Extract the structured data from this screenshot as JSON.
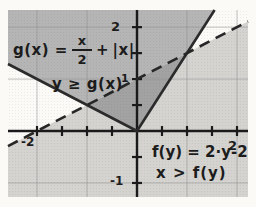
{
  "figure": {
    "bg": "#fbfaf7",
    "plot": {
      "left": 8,
      "top": 10,
      "right": 248,
      "bottom": 197
    },
    "grid_color": "#8f8f8f",
    "axis_color": "#1a1a1a"
  },
  "chart_data": {
    "type": "line",
    "title": "",
    "xlabel": "",
    "ylabel": "",
    "xlim": [
      -2.58,
      2.22
    ],
    "ylim": [
      -1.27,
      2.33
    ],
    "grid": true,
    "x_gridlines": [
      -2,
      -1,
      1,
      2
    ],
    "y_gridlines": [
      -1,
      1,
      2
    ],
    "x_ticks": [
      -2,
      -1.5,
      -1,
      -0.5,
      0.5,
      1,
      1.5,
      2
    ],
    "y_ticks": [
      -1,
      -0.5,
      0.5,
      1,
      1.5,
      2
    ],
    "series": [
      {
        "name": "g(x) = x/2 + |x|",
        "style": "solid",
        "color": "#2b2b2b",
        "width": 2.6,
        "points": [
          [
            -2.58,
            1.29
          ],
          [
            0,
            0
          ],
          [
            1.553,
            2.33
          ]
        ]
      },
      {
        "name": "x = f(y) = 2·y-2  (y = x/2 + 1)",
        "style": "dashed",
        "color": "#262626",
        "width": 2.6,
        "points": [
          [
            -2.58,
            -0.29
          ],
          [
            2.22,
            2.11
          ]
        ]
      }
    ],
    "regions": [
      {
        "name": "y >= g(x) only",
        "color": "#b5b5b5",
        "points": [
          [
            -2.58,
            2.33
          ],
          [
            -2.58,
            1.29
          ],
          [
            -1,
            0.5
          ],
          [
            1,
            1.5
          ],
          [
            1.553,
            2.33
          ]
        ]
      },
      {
        "name": "overlap y >= g(x) and x > f(y)",
        "color": "#a2a2a2",
        "points": [
          [
            -1,
            0.5
          ],
          [
            1,
            1.5
          ],
          [
            0,
            0
          ]
        ]
      },
      {
        "name": "x > f(y) only",
        "color": "#d4d3d0",
        "points": [
          [
            -2.58,
            -0.29
          ],
          [
            -1,
            0.5
          ],
          [
            0,
            0
          ],
          [
            1,
            1.5
          ],
          [
            2.22,
            2.11
          ],
          [
            2.22,
            -1.27
          ],
          [
            -2.58,
            -1.27
          ]
        ]
      }
    ]
  },
  "labels": {
    "g_lhs": "g(x) =",
    "g_frac_num": "x",
    "g_frac_den": "2",
    "g_plus": "+",
    "g_abs": "|x|",
    "g_ineq": "y ≥ g(x)",
    "f_eq": "f(y) = 2·y-2",
    "f_ineq": "x > f(y)",
    "tick_y2": "2",
    "tick_y1": "1",
    "tick_yneg1": "-1",
    "tick_xneg2": "-2",
    "tick_x2": "2"
  }
}
